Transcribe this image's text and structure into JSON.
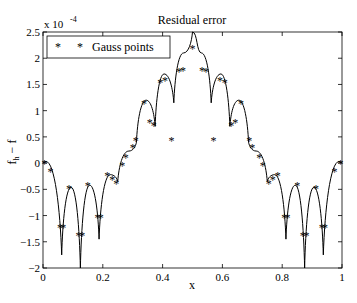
{
  "chart_data": {
    "type": "line",
    "title": "Residual error",
    "xlabel": "x",
    "ylabel": "f_h − f",
    "y_multiplier_label": "x 10",
    "y_multiplier_exponent": "-4",
    "xlim": [
      0,
      1
    ],
    "ylim": [
      -2,
      2.5
    ],
    "x_ticks": [
      "0",
      "0.2",
      "0.4",
      "0.6",
      "0.8",
      "1"
    ],
    "y_ticks": [
      "-2",
      "-1.5",
      "-1",
      "-0.5",
      "0",
      "0.5",
      "1",
      "1.5",
      "2",
      "2.5"
    ],
    "grid": false,
    "legend": {
      "position": "upper-left",
      "entries": [
        "Gauss points"
      ],
      "marker": "*"
    },
    "series": [
      {
        "name": "f_h - f (curve)",
        "style": "solid-line",
        "x": [
          0.0,
          0.0625,
          0.125,
          0.1875,
          0.25,
          0.3125,
          0.375,
          0.4375,
          0.5,
          0.5625,
          0.625,
          0.6875,
          0.75,
          0.8125,
          0.875,
          0.9375,
          1.0
        ],
        "values_at_nodes": [
          0.0,
          -1.75,
          -2.0,
          -1.45,
          -0.35,
          0.4,
          0.7,
          1.15,
          2.5,
          1.15,
          0.7,
          0.4,
          -0.35,
          -1.45,
          -2.0,
          -1.75,
          0.0
        ],
        "local_maxima": [
          {
            "x": 0.01,
            "y": 0.03
          },
          {
            "x": 0.094,
            "y": -0.46
          },
          {
            "x": 0.156,
            "y": -0.42
          },
          {
            "x": 0.225,
            "y": -0.22
          },
          {
            "x": 0.287,
            "y": 0.23
          },
          {
            "x": 0.345,
            "y": 1.2
          },
          {
            "x": 0.405,
            "y": 1.7
          },
          {
            "x": 0.47,
            "y": 2.1
          },
          {
            "x": 0.5,
            "y": 2.5
          },
          {
            "x": 0.53,
            "y": 2.1
          },
          {
            "x": 0.595,
            "y": 1.7
          },
          {
            "x": 0.655,
            "y": 1.2
          },
          {
            "x": 0.713,
            "y": 0.23
          },
          {
            "x": 0.775,
            "y": -0.22
          },
          {
            "x": 0.844,
            "y": -0.42
          },
          {
            "x": 0.906,
            "y": -0.46
          },
          {
            "x": 0.99,
            "y": 0.03
          }
        ]
      },
      {
        "name": "Gauss points",
        "style": "star-marker",
        "points": [
          [
            0.005,
            0.01
          ],
          [
            0.025,
            -0.15
          ],
          [
            0.057,
            -1.22
          ],
          [
            0.068,
            -1.22
          ],
          [
            0.087,
            -0.47
          ],
          [
            0.119,
            -1.38
          ],
          [
            0.131,
            -1.38
          ],
          [
            0.15,
            -0.42
          ],
          [
            0.182,
            -1.02
          ],
          [
            0.193,
            -1.02
          ],
          [
            0.215,
            -0.22
          ],
          [
            0.232,
            -0.3
          ],
          [
            0.245,
            -0.38
          ],
          [
            0.265,
            -0.04
          ],
          [
            0.277,
            0.12
          ],
          [
            0.3,
            0.3
          ],
          [
            0.31,
            0.45
          ],
          [
            0.338,
            1.15
          ],
          [
            0.357,
            0.78
          ],
          [
            0.37,
            0.72
          ],
          [
            0.392,
            1.55
          ],
          [
            0.408,
            1.58
          ],
          [
            0.43,
            0.45
          ],
          [
            0.455,
            1.75
          ],
          [
            0.468,
            1.78
          ],
          [
            0.5,
            2.2
          ],
          [
            0.532,
            1.78
          ],
          [
            0.545,
            1.75
          ],
          [
            0.57,
            0.45
          ],
          [
            0.592,
            1.58
          ],
          [
            0.608,
            1.55
          ],
          [
            0.63,
            0.72
          ],
          [
            0.643,
            0.78
          ],
          [
            0.662,
            1.15
          ],
          [
            0.69,
            0.45
          ],
          [
            0.7,
            0.3
          ],
          [
            0.723,
            0.12
          ],
          [
            0.735,
            -0.04
          ],
          [
            0.755,
            -0.38
          ],
          [
            0.768,
            -0.3
          ],
          [
            0.785,
            -0.22
          ],
          [
            0.807,
            -1.02
          ],
          [
            0.818,
            -1.02
          ],
          [
            0.85,
            -0.42
          ],
          [
            0.869,
            -1.38
          ],
          [
            0.881,
            -1.38
          ],
          [
            0.913,
            -0.47
          ],
          [
            0.932,
            -1.22
          ],
          [
            0.943,
            -1.22
          ],
          [
            0.975,
            -0.15
          ],
          [
            0.995,
            0.01
          ]
        ]
      }
    ]
  }
}
